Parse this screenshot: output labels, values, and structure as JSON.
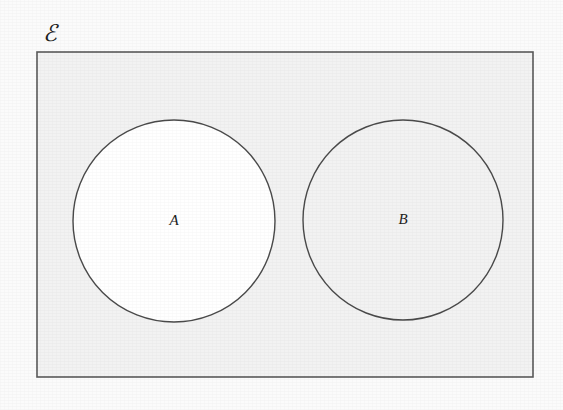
{
  "figure": {
    "type": "venn-diagram",
    "caption": "",
    "background_color": "#fbfbfb",
    "canvas": {
      "width": 563,
      "height": 410
    }
  },
  "universe": {
    "label": "ℰ",
    "label_x": 50,
    "label_y": 36,
    "rect": {
      "x": 37,
      "y": 52,
      "width": 496,
      "height": 325
    },
    "fill_color": "#f2f2f2",
    "stroke_color": "#5a5a5a"
  },
  "sets": [
    {
      "name": "set-a",
      "label": "A",
      "cx": 174,
      "cy": 221,
      "r": 101,
      "fill_color": "#ffffff",
      "stroke_color": "#4a4a4a"
    },
    {
      "name": "set-b",
      "label": "B",
      "cx": 403,
      "cy": 220,
      "r": 100,
      "fill_color": "#f2f2f2",
      "stroke_color": "#4a4a4a"
    }
  ],
  "chart_data": {
    "type": "diagram",
    "diagram_kind": "venn",
    "title": "",
    "regions": [
      {
        "id": "universe",
        "label": "ℰ",
        "description": "universal set rectangle"
      },
      {
        "id": "A",
        "label": "A",
        "description": "set A circle, disjoint from B"
      },
      {
        "id": "B",
        "label": "B",
        "description": "set B circle, disjoint from A"
      }
    ],
    "intersections": [],
    "relationship": "disjoint"
  }
}
